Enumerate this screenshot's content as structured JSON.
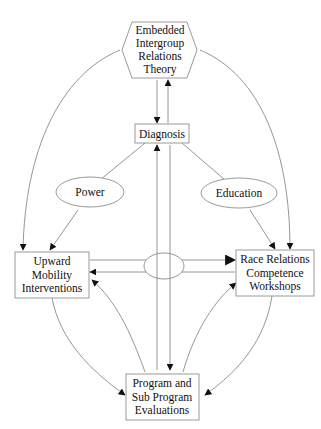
{
  "diagram": {
    "type": "flow-diagram",
    "nodes": {
      "theory": {
        "shape": "hexagon",
        "lines": [
          "Embedded",
          "Intergroup",
          "Relations",
          "Theory"
        ]
      },
      "diagnosis": {
        "shape": "rectangle",
        "lines": [
          "Diagnosis"
        ]
      },
      "power": {
        "shape": "ellipse",
        "lines": [
          "Power"
        ]
      },
      "education": {
        "shape": "ellipse",
        "lines": [
          "Education"
        ]
      },
      "upward": {
        "shape": "rectangle",
        "lines": [
          "Upward",
          "Mobility",
          "Interventions"
        ]
      },
      "race": {
        "shape": "rectangle",
        "lines": [
          "Race Relations",
          "Competence",
          "Workshops"
        ]
      },
      "evaluations": {
        "shape": "rectangle",
        "lines": [
          "Program and",
          "Sub Program",
          "Evaluations"
        ]
      },
      "junction": {
        "shape": "ellipse",
        "lines": []
      }
    },
    "edges": [
      {
        "from": "theory",
        "to": "diagnosis",
        "style": "straight"
      },
      {
        "from": "diagnosis",
        "to": "theory",
        "style": "straight"
      },
      {
        "from": "theory",
        "to": "upward",
        "style": "curved"
      },
      {
        "from": "theory",
        "to": "race",
        "style": "curved"
      },
      {
        "from": "diagnosis",
        "to": "upward",
        "via": "power",
        "style": "straight"
      },
      {
        "from": "diagnosis",
        "to": "race",
        "via": "education",
        "style": "straight"
      },
      {
        "from": "diagnosis",
        "to": "evaluations",
        "style": "straight"
      },
      {
        "from": "evaluations",
        "to": "diagnosis",
        "style": "straight"
      },
      {
        "from": "junction",
        "to": "upward",
        "style": "straight"
      },
      {
        "from": "junction",
        "to": "race",
        "style": "straight"
      },
      {
        "from": "upward",
        "to": "evaluations",
        "style": "curved"
      },
      {
        "from": "evaluations",
        "to": "upward",
        "style": "curved"
      },
      {
        "from": "race",
        "to": "evaluations",
        "style": "curved"
      },
      {
        "from": "evaluations",
        "to": "race",
        "style": "curved"
      }
    ],
    "colors": {
      "line": "#8a8a8a",
      "arrow": "#111111",
      "box_border": "#9a9a9a",
      "background": "#ffffff"
    }
  }
}
